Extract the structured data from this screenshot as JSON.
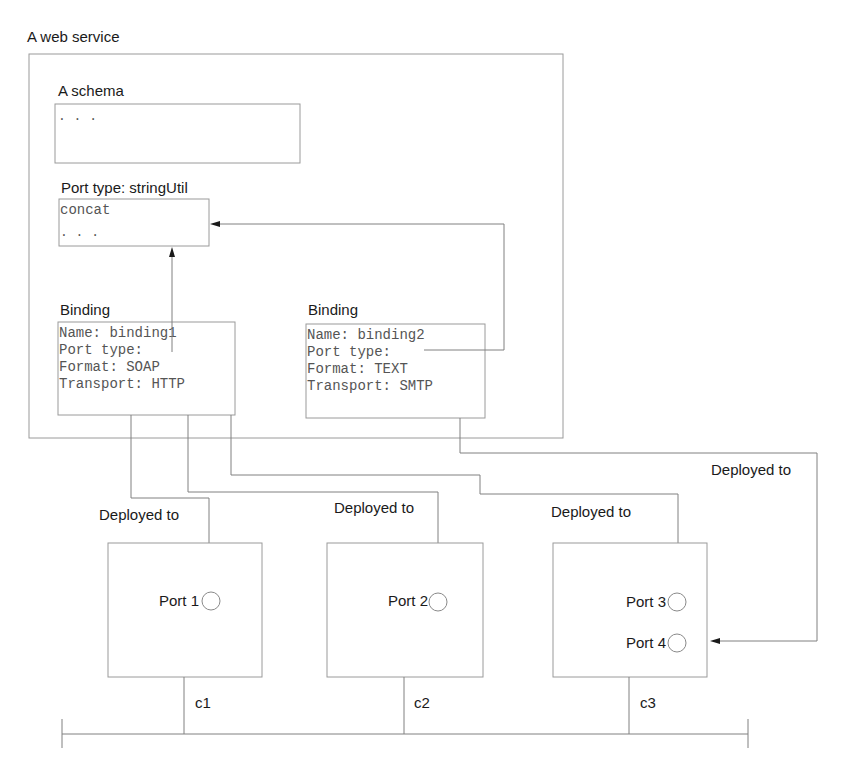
{
  "web_service": {
    "title": "A web service",
    "schema": {
      "title": "A schema",
      "content": ". . ."
    },
    "port_type": {
      "title": "Port type: stringUtil",
      "lines": [
        "concat",
        ". . ."
      ]
    },
    "bindings": [
      {
        "title": "Binding",
        "lines": [
          "Name: binding1",
          "Port type:",
          "Format: SOAP",
          "Transport: HTTP"
        ]
      },
      {
        "title": "Binding",
        "lines": [
          "Name: binding2",
          "Port type:",
          "Format: TEXT",
          "Transport: SMTP"
        ]
      }
    ]
  },
  "deployments": [
    {
      "label": "Deployed to"
    },
    {
      "label": "Deployed to"
    },
    {
      "label": "Deployed to"
    },
    {
      "label": "Deployed to"
    }
  ],
  "containers": [
    {
      "label": "c1",
      "ports": [
        "Port 1"
      ]
    },
    {
      "label": "c2",
      "ports": [
        "Port 2"
      ]
    },
    {
      "label": "c3",
      "ports": [
        "Port 3",
        "Port 4"
      ]
    }
  ],
  "colors": {
    "text": "#1a1a1a",
    "mono_text": "#555555",
    "lines": "#808080",
    "box_border": "#9a9a9a"
  }
}
